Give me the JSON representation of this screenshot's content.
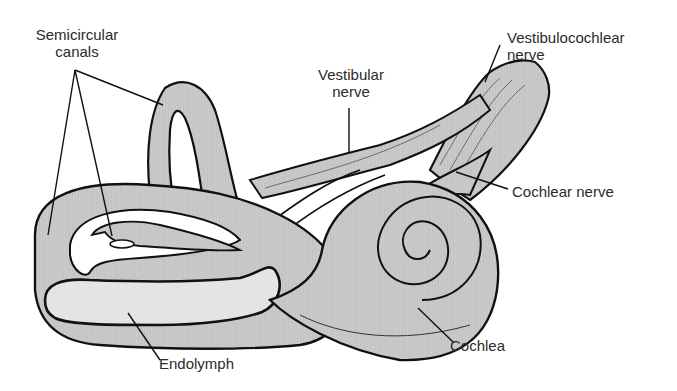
{
  "diagram": {
    "colors": {
      "structure_fill": "#c9c9c9",
      "endolymph_fill": "#e4e4e4",
      "outline": "#111111",
      "label_text": "#2b2b2b",
      "background": "#ffffff"
    },
    "labels": {
      "semicircular_canals_line1": "Semicircular",
      "semicircular_canals_line2": "canals",
      "vestibular_nerve_line1": "Vestibular",
      "vestibular_nerve_line2": "nerve",
      "vestibulocochlear_nerve_line1": "Vestibulocochlear",
      "vestibulocochlear_nerve_line2": "nerve",
      "cochlear_nerve": "Cochlear nerve",
      "endolymph": "Endolymph",
      "cochlea": "Cochlea"
    }
  }
}
